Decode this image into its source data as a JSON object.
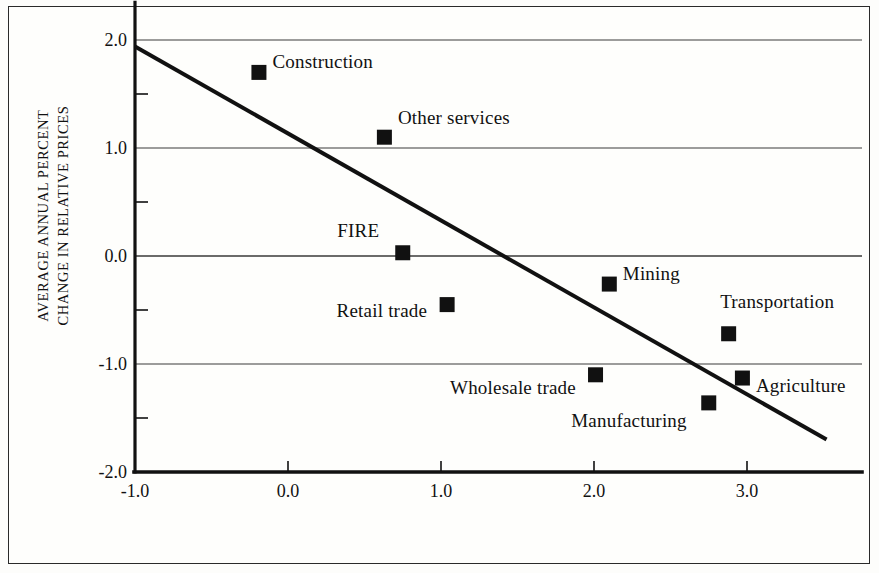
{
  "chart_data": {
    "type": "scatter",
    "title": "",
    "subtitle": "",
    "xlabel": "",
    "ylabel_line1": "AVERAGE ANNUAL PERCENT",
    "ylabel_line2": "CHANGE IN RELATIVE PRICES",
    "xlim": [
      -1.0,
      3.6
    ],
    "ylim": [
      -2.0,
      2.2
    ],
    "grid": "horizontal-major",
    "legend": "none",
    "x_ticks": [
      "-1.0",
      "0.0",
      "1.0",
      "2.0",
      "3.0"
    ],
    "x_tick_values": [
      -1.0,
      0.0,
      1.0,
      2.0,
      3.0
    ],
    "y_ticks": [
      "2.0",
      "1.0",
      "0.0",
      "-1.0",
      "-2.0"
    ],
    "y_tick_values": [
      2.0,
      1.0,
      0.0,
      -1.0,
      -2.0
    ],
    "y_minor_tick_values": [
      1.5,
      0.5,
      -0.5,
      -1.5
    ],
    "marker": "filled-square",
    "marker_color": "#111111",
    "points": [
      {
        "label": "Construction",
        "x": -0.19,
        "y": 1.7,
        "label_dx": 16,
        "label_dy": -10,
        "label_align": "left"
      },
      {
        "label": "Other services",
        "x": 0.63,
        "y": 1.1,
        "label_dx": 16,
        "label_dy": -19,
        "label_align": "left"
      },
      {
        "label": "FIRE",
        "x": 0.75,
        "y": 0.03,
        "label_dx": -16,
        "label_dy": -22,
        "label_align": "right"
      },
      {
        "label": "Mining",
        "x": 2.1,
        "y": -0.26,
        "label_dx": 16,
        "label_dy": -10,
        "label_align": "left"
      },
      {
        "label": "Retail trade",
        "x": 1.04,
        "y": -0.45,
        "label_dx": -12,
        "label_dy": 6,
        "label_align": "right"
      },
      {
        "label": "Transportation",
        "x": 2.88,
        "y": -0.72,
        "label_dx": -6,
        "label_dy": -32,
        "label_align": "left"
      },
      {
        "label": "Wholesale trade",
        "x": 2.01,
        "y": -1.1,
        "label_dx": -12,
        "label_dy": 13,
        "label_align": "right"
      },
      {
        "label": "Agriculture",
        "x": 2.97,
        "y": -1.13,
        "label_dx": 16,
        "label_dy": 8,
        "label_align": "left"
      },
      {
        "label": "Manufacturing",
        "x": 2.75,
        "y": -1.36,
        "label_dx": -14,
        "label_dy": 18,
        "label_align": "right"
      }
    ],
    "trend_line": {
      "x_start": -1.0,
      "y_start": 1.94,
      "x_end": 3.52,
      "y_end": -1.7,
      "slope": -0.806,
      "intercept": 1.134,
      "color": "#111111",
      "width_px": 4
    }
  }
}
